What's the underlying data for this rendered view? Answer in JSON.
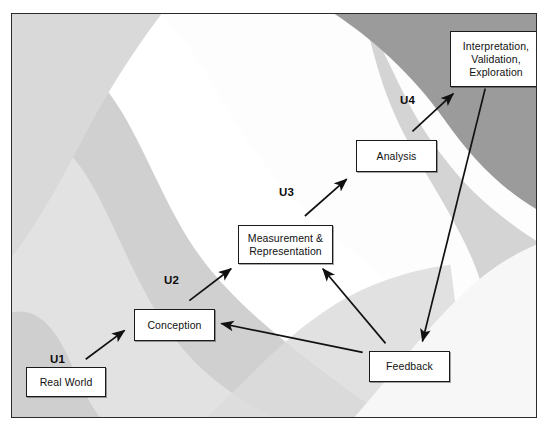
{
  "figure": {
    "kind": "process-flow-diagram",
    "frame": {
      "border_color": "#2b2b2b"
    },
    "background": {
      "description": "diagonal wavy grayscale bands",
      "tones": [
        "#ffffff",
        "#fbfbfb",
        "#ededed",
        "#e0e0e0",
        "#d2d2d2",
        "#c4c4c4",
        "#9a9a9a"
      ]
    },
    "nodes": [
      {
        "id": "real-world",
        "label": "Real World",
        "x": 14,
        "y": 353,
        "w": 80,
        "h": 30
      },
      {
        "id": "conception",
        "label": "Conception",
        "x": 122,
        "y": 295,
        "w": 81,
        "h": 32
      },
      {
        "id": "measurement-representation",
        "label": "Measurement &\nRepresentation",
        "x": 226,
        "y": 211,
        "w": 95,
        "h": 39
      },
      {
        "id": "analysis",
        "label": "Analysis",
        "x": 344,
        "y": 126,
        "w": 81,
        "h": 32
      },
      {
        "id": "interpretation-validation-exploration",
        "label": "Interpretation,\nValidation,\nExploration",
        "x": 438,
        "y": 17,
        "w": 92,
        "h": 56
      },
      {
        "id": "feedback",
        "label": "Feedback",
        "x": 357,
        "y": 337,
        "w": 81,
        "h": 31
      }
    ],
    "step_labels": [
      {
        "id": "u1",
        "text": "U1",
        "x": 51,
        "y": 354
      },
      {
        "id": "u2",
        "text": "U2",
        "x": 163,
        "y": 274
      },
      {
        "id": "u3",
        "text": "U3",
        "x": 279,
        "y": 186
      },
      {
        "id": "u4",
        "text": "U4",
        "x": 400,
        "y": 93
      }
    ],
    "connectors": [
      {
        "id": "real-world-to-conception",
        "from": "real-world",
        "to": "conception",
        "label": "U1"
      },
      {
        "id": "conception-to-measurement",
        "from": "conception",
        "to": "measurement-representation",
        "label": "U2"
      },
      {
        "id": "measurement-to-analysis",
        "from": "measurement-representation",
        "to": "analysis",
        "label": "U3"
      },
      {
        "id": "analysis-to-interpretation",
        "from": "analysis",
        "to": "interpretation-validation-exploration",
        "label": "U4"
      },
      {
        "id": "interpretation-to-feedback",
        "from": "interpretation-validation-exploration",
        "to": "feedback",
        "label": ""
      },
      {
        "id": "feedback-to-measurement",
        "from": "feedback",
        "to": "measurement-representation",
        "label": ""
      },
      {
        "id": "feedback-to-conception",
        "from": "feedback",
        "to": "conception",
        "label": ""
      }
    ]
  }
}
